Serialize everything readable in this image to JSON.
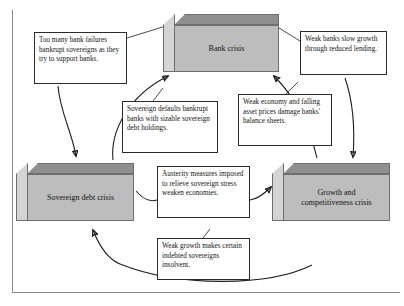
{
  "diagram": {
    "frame_color": "#8a8a8a",
    "node_face_color": "#bdbdbd",
    "node_top_color": "#8f8f8f",
    "node_side_color": "#d4d4d4",
    "arrow_color": "#1d1d1d",
    "callout_border_color": "#2a2a2a",
    "nodes": [
      {
        "id": "bank-crisis",
        "label": "Bank crisis"
      },
      {
        "id": "sovereign-debt-crisis",
        "label": "Sovereign debt crisis"
      },
      {
        "id": "growth-competitiveness-crisis",
        "label_line1": "Growth and",
        "label_line2": "competitiveness crisis"
      }
    ],
    "callouts": [
      {
        "id": "too-many-bank-failures",
        "text": "Too many bank failures bankrupt sovereigns as they try to support banks.",
        "from": "bank-crisis",
        "to": "sovereign-debt-crisis"
      },
      {
        "id": "weak-banks-slow-growth",
        "text": "Weak banks slow growth through reduced lending.",
        "from": "bank-crisis",
        "to": "growth-competitiveness-crisis"
      },
      {
        "id": "sovereign-defaults-bankrupt-banks",
        "text": "Sovereign defaults bankrupt banks with sizable sovereign debt holdings.",
        "from": "sovereign-debt-crisis",
        "to": "bank-crisis"
      },
      {
        "id": "weak-economy-damages-banks",
        "text": "Weak economy and falling asset prices damage banks' balance sheets.",
        "from": "growth-competitiveness-crisis",
        "to": "bank-crisis"
      },
      {
        "id": "austerity-weakens-economies",
        "text": "Austerity measures imposed to relieve sovereign stress weaken economies.",
        "from": "sovereign-debt-crisis",
        "to": "growth-competitiveness-crisis"
      },
      {
        "id": "weak-growth-insolvent-sovereigns",
        "text": "Weak growth makes certain indebted sovereigns insolvent.",
        "from": "growth-competitiveness-crisis",
        "to": "sovereign-debt-crisis"
      }
    ]
  }
}
